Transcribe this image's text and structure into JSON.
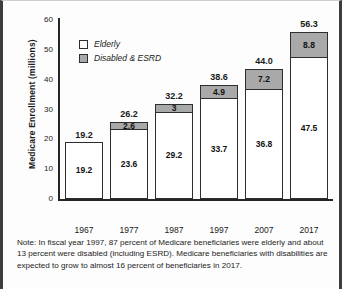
{
  "chart_data": {
    "type": "bar",
    "subtype": "stacked-vertical",
    "title": "",
    "xlabel": "",
    "ylabel": "Medicare Enrollment (millions)",
    "ylim": [
      0,
      60
    ],
    "yticks": [
      0,
      10,
      20,
      30,
      40,
      50,
      60
    ],
    "ytick_labels": [
      "0",
      "10",
      "20",
      "30",
      "40",
      "50",
      "60"
    ],
    "grid": false,
    "legend_position": "upper-left-inside",
    "categories": [
      "1967",
      "1977",
      "1987",
      "1997",
      "2007",
      "2017"
    ],
    "series": [
      {
        "name": "Elderly",
        "color": "#ffffff",
        "values": [
          19.2,
          23.6,
          29.2,
          33.7,
          36.8,
          47.5
        ],
        "labels": [
          "19.2",
          "23.6",
          "29.2",
          "33.7",
          "36.8",
          "47.5"
        ]
      },
      {
        "name": "Disabled & ESRD",
        "color": "#a9a9a9",
        "values": [
          0,
          2.6,
          3,
          4.9,
          7.2,
          8.8
        ],
        "labels": [
          "",
          "2.6",
          "3",
          "4.9",
          "7.2",
          "8.8"
        ]
      }
    ],
    "totals": [
      19.2,
      26.2,
      32.2,
      38.6,
      44.0,
      56.3
    ],
    "total_labels": [
      "19.2",
      "26.2",
      "32.2",
      "38.6",
      "44.0",
      "56.3"
    ],
    "annotations": []
  },
  "legend": {
    "items": [
      {
        "label": "Elderly",
        "color": "#ffffff"
      },
      {
        "label": "Disabled & ESRD",
        "color": "#a9a9a9"
      }
    ]
  },
  "note": {
    "text": "Note: In fiscal year 1997, 87 percent of Medicare beneficiaries were elderly and about 13 percent were disabled (including ESRD). Medicare beneficiaries with disabilities are expected to grow to almost 16 percent of beneficiaries in 2017."
  }
}
